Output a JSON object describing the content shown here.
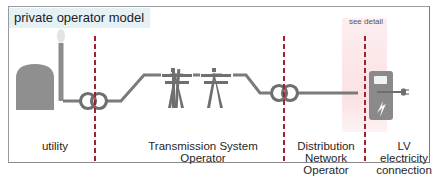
{
  "title": "private operator model",
  "annotation": "see detail",
  "colors": {
    "frame_border": "#9a9a9a",
    "title_background": "#e6f1f6",
    "divider": "#a3202a",
    "icon_gray": "#7a7a7a",
    "utility_gray": "#8c8c8c",
    "highlight": "#fbe1e4"
  },
  "segments": [
    {
      "id": "utility",
      "icon": "power-plant-icon",
      "label_lines": [
        "utility"
      ]
    },
    {
      "id": "tso",
      "icon": "transmission-tower-icon",
      "label_lines": [
        "Transmission System",
        "Operator"
      ]
    },
    {
      "id": "dno",
      "icon": "transformer-icon",
      "label_lines": [
        "Distribution",
        "Network",
        "Operator"
      ]
    },
    {
      "id": "lv",
      "icon": "charging-station-icon",
      "label_lines": [
        "LV",
        "electricity",
        "connection"
      ]
    }
  ],
  "labels": {
    "utility": "utility",
    "tso_line1": "Transmission System",
    "tso_line2": "Operator",
    "dno_line1": "Distribution",
    "dno_line2": "Network",
    "dno_line3": "Operator",
    "lv_line1": "LV",
    "lv_line2": "electricity",
    "lv_line3": "connection"
  }
}
